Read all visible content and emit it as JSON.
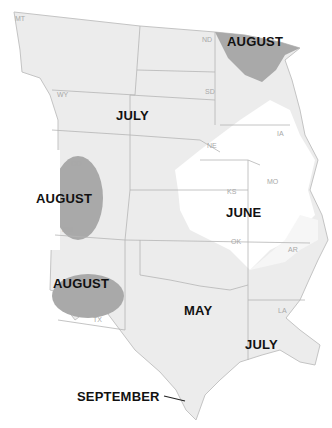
{
  "map": {
    "colors": {
      "background": "#ffffff",
      "land_light": "#ececec",
      "land_lighter": "#f6f6f6",
      "land_white": "#ffffff",
      "august_shade": "#a9a9a9",
      "border": "#b5b5b5"
    },
    "region_labels": [
      {
        "id": "august-north",
        "text": "AUGUST"
      },
      {
        "id": "july-north",
        "text": "JULY"
      },
      {
        "id": "august-west",
        "text": "AUGUST"
      },
      {
        "id": "june",
        "text": "JUNE"
      },
      {
        "id": "august-southwest",
        "text": "AUGUST"
      },
      {
        "id": "may",
        "text": "MAY"
      },
      {
        "id": "july-south",
        "text": "JULY"
      },
      {
        "id": "september",
        "text": "SEPTEMBER"
      }
    ],
    "state_labels": [
      "MT",
      "ND",
      "WY",
      "SD",
      "NE",
      "IA",
      "CO",
      "KS",
      "MO",
      "NM",
      "OK",
      "AR",
      "TX",
      "LA"
    ]
  }
}
